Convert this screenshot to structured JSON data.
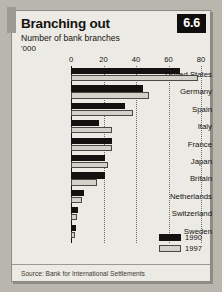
{
  "figure": {
    "badge": "6.6",
    "title": "Branching out",
    "subtitle": "Number of bank branches",
    "unit": "'000",
    "source": "Source: Bank for International Settlements"
  },
  "legend": {
    "items": [
      {
        "label": "1990",
        "color": "#131210"
      },
      {
        "label": "1997",
        "color": "#d3d1ca"
      }
    ]
  },
  "chart_data": {
    "type": "bar",
    "orientation": "horizontal",
    "title": "Branching out",
    "subtitle": "Number of bank branches",
    "xlabel": "'000",
    "ylabel": "",
    "xlim": [
      0,
      80
    ],
    "xticks": [
      0,
      20,
      40,
      60,
      80
    ],
    "xtick_labels": [
      "0",
      "20",
      "40",
      "60",
      "80"
    ],
    "grid": true,
    "legend_position": "bottom-right",
    "categories": [
      "United States",
      "Germany",
      "Spain",
      "Italy",
      "France",
      "Japan",
      "Britain",
      "Netherlands",
      "Switzerland",
      "Sweden"
    ],
    "series": [
      {
        "name": "1990",
        "color": "#131210",
        "values": [
          67,
          44,
          33,
          17,
          25.5,
          21,
          21,
          8,
          4.5,
          3
        ]
      },
      {
        "name": "1997",
        "color": "#d3d1ca",
        "values": [
          78,
          48,
          38,
          25,
          25.5,
          23,
          16,
          7,
          3.5,
          2.5
        ]
      }
    ]
  }
}
